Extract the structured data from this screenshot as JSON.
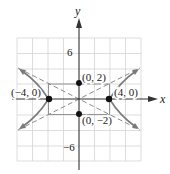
{
  "figure": {
    "axes": {
      "x_label": "x",
      "y_label": "y",
      "tick_labels": {
        "y_pos": "6",
        "y_neg": "−6"
      },
      "grid_range": [
        -8,
        8
      ],
      "grid_step": 2
    },
    "hyperbola": {
      "equation": "x^2/16 - y^2/4 = 1",
      "asymptotes": [
        "y = x/2",
        "y = -x/2"
      ],
      "curve_color": "#7a7a7a",
      "asymptote_color": "#8a8a8a"
    },
    "points": [
      {
        "label": "(0, 2)",
        "x": 0,
        "y": 2
      },
      {
        "label": "(0, −2)",
        "x": 0,
        "y": -2
      },
      {
        "label": "(−4, 0)",
        "x": -4,
        "y": 0
      },
      {
        "label": "(4, 0)",
        "x": 4,
        "y": 0
      }
    ]
  }
}
